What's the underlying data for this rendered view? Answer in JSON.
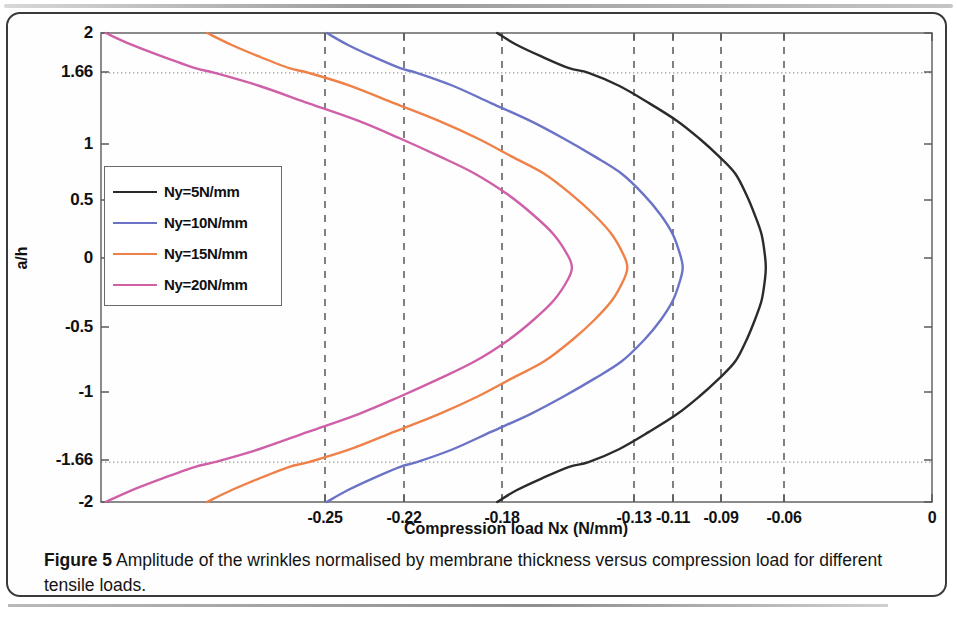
{
  "figure": {
    "caption_label": "Figure 5",
    "caption_text": " Amplitude of the wrinkles normalised by membrane thickness versus compression load for different tensile loads."
  },
  "chart_data": {
    "type": "line",
    "title": "",
    "xlabel": "Compression load Nx (N/mm)",
    "ylabel": "a/h",
    "xlim": [
      -0.3,
      0.0
    ],
    "ylim": [
      -2,
      2
    ],
    "grid": "dashed vertical gridlines at each labelled x tick; dotted horizontal gridlines at a/h = 1.66 and -1.66",
    "legend_position": "upper left inside axes",
    "xticks": [
      -0.25,
      -0.22,
      -0.18,
      -0.13,
      -0.11,
      -0.09,
      -0.06,
      0
    ],
    "xtick_labels": [
      "-0.25",
      "-0.22",
      "-0.18",
      "-0.13",
      "-0.11",
      "-0.09",
      "-0.06",
      "0"
    ],
    "xtick_px": [
      325,
      404,
      502,
      634,
      673,
      721,
      784,
      932
    ],
    "yticks": [
      2,
      1.66,
      1,
      0.5,
      0,
      -0.5,
      -1,
      -1.66,
      -2
    ],
    "ytick_labels": [
      "2",
      "1.66",
      "1",
      "0.5",
      "0",
      "-0.5",
      "-1",
      "-1.66",
      "-2"
    ],
    "ytick_px": [
      33,
      72,
      144,
      200,
      258,
      327,
      392,
      460,
      502
    ],
    "hgrid_values": [
      1.66,
      -1.66
    ],
    "series": [
      {
        "name": "Ny=5N/mm",
        "color": "#2b2b2b",
        "critical_x": -0.06,
        "vertex_px": [
          784,
          262
        ],
        "end_top_px": [
          556,
          33
        ],
        "end_bottom_px": [
          556,
          502
        ],
        "points": [
          [
            -0.157,
            2.0
          ],
          [
            -0.15,
            1.9
          ],
          [
            -0.141,
            1.8
          ],
          [
            -0.131,
            1.7
          ],
          [
            -0.124,
            1.66
          ],
          [
            -0.113,
            1.55
          ],
          [
            -0.102,
            1.4
          ],
          [
            -0.092,
            1.25
          ],
          [
            -0.084,
            1.1
          ],
          [
            -0.077,
            0.95
          ],
          [
            -0.071,
            0.8
          ],
          [
            -0.067,
            0.62
          ],
          [
            -0.064,
            0.45
          ],
          [
            -0.0615,
            0.28
          ],
          [
            -0.0603,
            0.1
          ],
          [
            -0.06,
            0.0
          ],
          [
            -0.0603,
            -0.1
          ],
          [
            -0.0615,
            -0.28
          ],
          [
            -0.064,
            -0.45
          ],
          [
            -0.067,
            -0.62
          ],
          [
            -0.071,
            -0.8
          ],
          [
            -0.077,
            -0.95
          ],
          [
            -0.084,
            -1.1
          ],
          [
            -0.092,
            -1.25
          ],
          [
            -0.102,
            -1.4
          ],
          [
            -0.113,
            -1.55
          ],
          [
            -0.124,
            -1.66
          ],
          [
            -0.131,
            -1.7
          ],
          [
            -0.141,
            -1.8
          ],
          [
            -0.15,
            -1.9
          ],
          [
            -0.157,
            -2.0
          ]
        ]
      },
      {
        "name": "Ny=10N/mm",
        "color": "#6a73c6",
        "critical_x": -0.09,
        "vertex_px": [
          721,
          262
        ],
        "end_top_px": [
          403,
          33
        ],
        "end_bottom_px": [
          403,
          502
        ],
        "points": [
          [
            -0.2185,
            2.0
          ],
          [
            -0.211,
            1.9
          ],
          [
            -0.202,
            1.8
          ],
          [
            -0.192,
            1.7
          ],
          [
            -0.186,
            1.66
          ],
          [
            -0.173,
            1.55
          ],
          [
            -0.159,
            1.4
          ],
          [
            -0.145,
            1.25
          ],
          [
            -0.133,
            1.1
          ],
          [
            -0.122,
            0.95
          ],
          [
            -0.112,
            0.8
          ],
          [
            -0.104,
            0.62
          ],
          [
            -0.098,
            0.45
          ],
          [
            -0.0935,
            0.28
          ],
          [
            -0.0908,
            0.1
          ],
          [
            -0.09,
            0.0
          ],
          [
            -0.0908,
            -0.1
          ],
          [
            -0.0935,
            -0.28
          ],
          [
            -0.098,
            -0.45
          ],
          [
            -0.104,
            -0.62
          ],
          [
            -0.112,
            -0.8
          ],
          [
            -0.122,
            -0.95
          ],
          [
            -0.133,
            -1.1
          ],
          [
            -0.145,
            -1.25
          ],
          [
            -0.159,
            -1.4
          ],
          [
            -0.173,
            -1.55
          ],
          [
            -0.186,
            -1.66
          ],
          [
            -0.192,
            -1.7
          ],
          [
            -0.202,
            -1.8
          ],
          [
            -0.211,
            -1.9
          ],
          [
            -0.2185,
            -2.0
          ]
        ]
      },
      {
        "name": "Ny=15N/mm",
        "color": "#ef8148",
        "critical_x": -0.11,
        "vertex_px": [
          673,
          262
        ],
        "end_top_px": [
          281,
          33
        ],
        "end_bottom_px": [
          281,
          502
        ],
        "points": [
          [
            -0.2617,
            2.0
          ],
          [
            -0.253,
            1.9
          ],
          [
            -0.243,
            1.8
          ],
          [
            -0.232,
            1.7
          ],
          [
            -0.225,
            1.66
          ],
          [
            -0.21,
            1.55
          ],
          [
            -0.194,
            1.4
          ],
          [
            -0.178,
            1.25
          ],
          [
            -0.164,
            1.1
          ],
          [
            -0.152,
            0.95
          ],
          [
            -0.14,
            0.8
          ],
          [
            -0.13,
            0.62
          ],
          [
            -0.122,
            0.45
          ],
          [
            -0.1155,
            0.28
          ],
          [
            -0.1112,
            0.1
          ],
          [
            -0.11,
            0.0
          ],
          [
            -0.1112,
            -0.1
          ],
          [
            -0.1155,
            -0.28
          ],
          [
            -0.122,
            -0.45
          ],
          [
            -0.13,
            -0.62
          ],
          [
            -0.14,
            -0.8
          ],
          [
            -0.152,
            -0.95
          ],
          [
            -0.164,
            -1.1
          ],
          [
            -0.178,
            -1.25
          ],
          [
            -0.194,
            -1.4
          ],
          [
            -0.21,
            -1.55
          ],
          [
            -0.225,
            -1.66
          ],
          [
            -0.232,
            -1.7
          ],
          [
            -0.243,
            -1.8
          ],
          [
            -0.253,
            -1.9
          ],
          [
            -0.2617,
            -2.0
          ]
        ]
      },
      {
        "name": "Ny=20N/mm",
        "color": "#cf60a8",
        "critical_x": -0.13,
        "vertex_px": [
          634,
          262
        ],
        "end_top_px": [
          180,
          33
        ],
        "end_bottom_px": [
          180,
          502
        ],
        "points": [
          [
            -0.2983,
            2.0
          ],
          [
            -0.289,
            1.9
          ],
          [
            -0.278,
            1.8
          ],
          [
            -0.266,
            1.7
          ],
          [
            -0.259,
            1.66
          ],
          [
            -0.243,
            1.55
          ],
          [
            -0.225,
            1.4
          ],
          [
            -0.207,
            1.25
          ],
          [
            -0.192,
            1.1
          ],
          [
            -0.178,
            0.95
          ],
          [
            -0.165,
            0.8
          ],
          [
            -0.153,
            0.62
          ],
          [
            -0.144,
            0.45
          ],
          [
            -0.1365,
            0.28
          ],
          [
            -0.1314,
            0.1
          ],
          [
            -0.13,
            0.0
          ],
          [
            -0.1314,
            -0.1
          ],
          [
            -0.1365,
            -0.28
          ],
          [
            -0.144,
            -0.45
          ],
          [
            -0.153,
            -0.62
          ],
          [
            -0.165,
            -0.8
          ],
          [
            -0.178,
            -0.95
          ],
          [
            -0.192,
            -1.1
          ],
          [
            -0.207,
            -1.25
          ],
          [
            -0.225,
            -1.4
          ],
          [
            -0.243,
            -1.55
          ],
          [
            -0.259,
            -1.66
          ],
          [
            -0.266,
            -1.7
          ],
          [
            -0.278,
            -1.8
          ],
          [
            -0.289,
            -1.9
          ],
          [
            -0.2983,
            -2.0
          ]
        ]
      }
    ]
  },
  "legend": {
    "items": [
      {
        "label": "Ny=5N/mm",
        "color": "#2b2b2b"
      },
      {
        "label": "Ny=10N/mm",
        "color": "#6a73c6"
      },
      {
        "label": "Ny=15N/mm",
        "color": "#ef8148"
      },
      {
        "label": "Ny=20N/mm",
        "color": "#cf60a8"
      }
    ]
  }
}
